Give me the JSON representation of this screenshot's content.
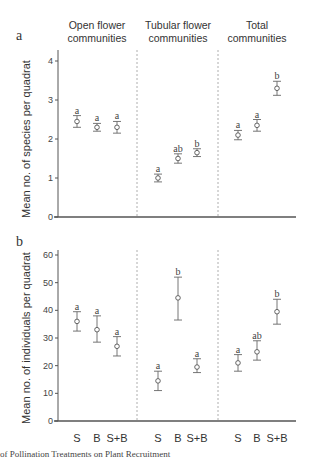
{
  "figure": {
    "caption_fragment": "of Pollination Treatments on Plant Recruitment",
    "column_headers": [
      {
        "line1": "Open flower",
        "line2": "communities"
      },
      {
        "line1": "Tubular flower",
        "line2": "communities"
      },
      {
        "line1": "Total",
        "line2": "communities"
      }
    ],
    "panel_labels": [
      "a",
      "b"
    ],
    "x_categories": [
      "S",
      "B",
      "S+B"
    ]
  },
  "chart_data": [
    {
      "type": "scatter",
      "panel": "a",
      "ylabel": "Mean no. of species per quadrat",
      "xlabel": "",
      "ylim": [
        0,
        4.2
      ],
      "yticks": [
        0,
        1,
        2,
        3,
        4
      ],
      "groups": [
        "Open flower communities",
        "Tubular flower communities",
        "Total communities"
      ],
      "categories": [
        "S",
        "B",
        "S+B"
      ],
      "series": [
        {
          "name": "Open flower communities",
          "values": [
            2.45,
            2.3,
            2.3
          ],
          "err_low": [
            2.3,
            2.2,
            2.15
          ],
          "err_high": [
            2.6,
            2.4,
            2.45
          ],
          "letters": [
            "a",
            "a",
            "a"
          ]
        },
        {
          "name": "Tubular flower communities",
          "values": [
            1.0,
            1.5,
            1.65
          ],
          "err_low": [
            0.9,
            1.38,
            1.55
          ],
          "err_high": [
            1.1,
            1.62,
            1.75
          ],
          "letters": [
            "a",
            "ab",
            "b"
          ]
        },
        {
          "name": "Total communities",
          "values": [
            2.1,
            2.35,
            3.3
          ],
          "err_low": [
            1.98,
            2.2,
            3.12
          ],
          "err_high": [
            2.22,
            2.5,
            3.48
          ],
          "letters": [
            "a",
            "a",
            "b"
          ]
        }
      ]
    },
    {
      "type": "scatter",
      "panel": "b",
      "ylabel": "Mean no. of individuals per quadrat",
      "xlabel": "",
      "ylim": [
        0,
        62
      ],
      "yticks": [
        0,
        10,
        20,
        30,
        40,
        50,
        60
      ],
      "groups": [
        "Open flower communities",
        "Tubular flower communities",
        "Total communities"
      ],
      "categories": [
        "S",
        "B",
        "S+B"
      ],
      "series": [
        {
          "name": "Open flower communities",
          "values": [
            36,
            33,
            27
          ],
          "err_low": [
            32.5,
            28.5,
            23.5
          ],
          "err_high": [
            39.5,
            38,
            30.5
          ],
          "letters": [
            "a",
            "a",
            "a"
          ]
        },
        {
          "name": "Tubular flower communities",
          "values": [
            14.5,
            44.5,
            19.5
          ],
          "err_low": [
            11,
            36.5,
            17.5
          ],
          "err_high": [
            18,
            52,
            22.5
          ],
          "letters": [
            "a",
            "b",
            "a"
          ]
        },
        {
          "name": "Total communities",
          "values": [
            21,
            25,
            39.5
          ],
          "err_low": [
            18,
            22,
            35
          ],
          "err_high": [
            24,
            29,
            44
          ],
          "letters": [
            "a",
            "ab",
            "b"
          ]
        }
      ]
    }
  ]
}
